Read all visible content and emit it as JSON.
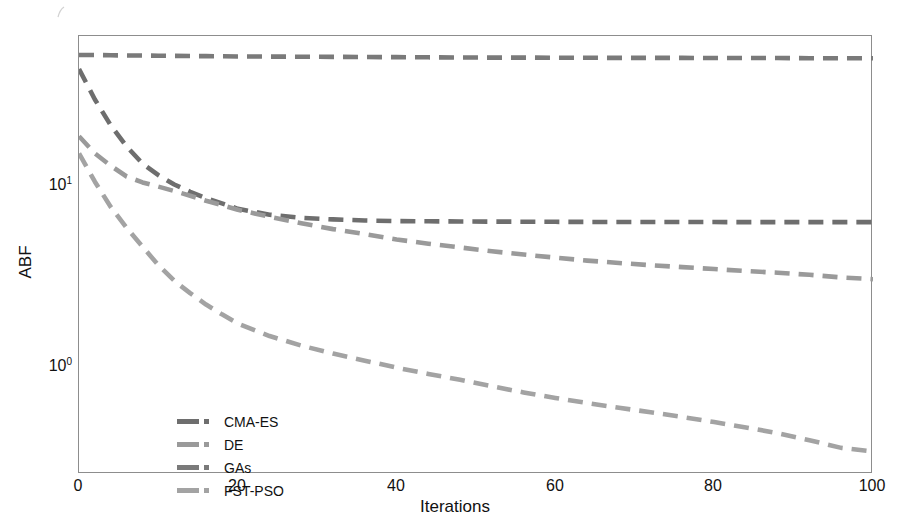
{
  "figure": {
    "background": "#ffffff",
    "frame_color": "#8d8d8d"
  },
  "axes": {
    "xlabel": "Iterations",
    "ylabel": "ABF",
    "xticks": [
      "0",
      "20",
      "40",
      "60",
      "80",
      "100"
    ],
    "xtick_values": [
      0,
      20,
      40,
      60,
      80,
      100
    ],
    "ytick_labels": [
      "10",
      "10"
    ],
    "ytick_exponents": [
      "1",
      "0"
    ],
    "ytick_values": [
      10,
      1
    ]
  },
  "legend": {
    "items": [
      {
        "label": "CMA-ES",
        "color": "#6e6e6e"
      },
      {
        "label": "DE",
        "color": "#9a9a9a"
      },
      {
        "label": "GAs",
        "color": "#7a7a7a"
      },
      {
        "label": "FST-PSO",
        "color": "#a3a3a3"
      }
    ]
  },
  "chart_data": {
    "type": "line",
    "title": "",
    "xlabel": "Iterations",
    "ylabel": "ABF",
    "xlim": [
      0,
      100
    ],
    "ylim": [
      0.33,
      72
    ],
    "yscale": "log",
    "xscale": "linear",
    "grid": false,
    "legend_position": "lower-left-inside",
    "linestyle": "dashed",
    "x": [
      0,
      2,
      4,
      6,
      8,
      10,
      12,
      14,
      16,
      18,
      20,
      24,
      28,
      32,
      36,
      40,
      44,
      48,
      52,
      56,
      60,
      64,
      68,
      72,
      76,
      80,
      84,
      88,
      92,
      96,
      100
    ],
    "series": [
      {
        "name": "CMA-ES",
        "color": "#6e6e6e",
        "values": [
          48.0,
          33.0,
          24.0,
          18.5,
          15.0,
          13.0,
          11.6,
          10.6,
          9.8,
          9.2,
          8.6,
          8.0,
          7.7,
          7.55,
          7.45,
          7.4,
          7.38,
          7.36,
          7.35,
          7.34,
          7.33,
          7.32,
          7.32,
          7.31,
          7.31,
          7.31,
          7.3,
          7.3,
          7.3,
          7.3,
          7.3
        ]
      },
      {
        "name": "DE",
        "color": "#9a9a9a",
        "values": [
          21.0,
          17.0,
          14.6,
          12.8,
          11.9,
          11.3,
          10.7,
          10.1,
          9.5,
          9.0,
          8.5,
          7.8,
          7.2,
          6.7,
          6.3,
          5.9,
          5.6,
          5.35,
          5.1,
          4.9,
          4.72,
          4.55,
          4.42,
          4.3,
          4.2,
          4.1,
          4.0,
          3.92,
          3.82,
          3.7,
          3.62
        ]
      },
      {
        "name": "GAs",
        "color": "#7a7a7a",
        "values": [
          57.0,
          57.0,
          56.8,
          56.7,
          56.6,
          56.5,
          56.4,
          56.3,
          56.2,
          56.1,
          56.0,
          55.9,
          55.8,
          55.7,
          55.6,
          55.5,
          55.4,
          55.3,
          55.2,
          55.2,
          55.1,
          55.1,
          55.0,
          55.0,
          55.0,
          54.9,
          54.9,
          54.9,
          54.8,
          54.8,
          54.8
        ]
      },
      {
        "name": "FST-PSO",
        "color": "#a3a3a3",
        "values": [
          17.0,
          12.0,
          8.8,
          6.8,
          5.4,
          4.3,
          3.55,
          3.05,
          2.65,
          2.35,
          2.1,
          1.8,
          1.6,
          1.45,
          1.33,
          1.22,
          1.13,
          1.05,
          0.97,
          0.9,
          0.84,
          0.79,
          0.745,
          0.705,
          0.665,
          0.625,
          0.585,
          0.545,
          0.5,
          0.455,
          0.435
        ]
      }
    ]
  }
}
